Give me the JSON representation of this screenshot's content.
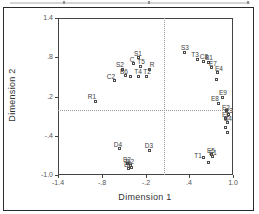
{
  "chart_data": {
    "type": "scatter",
    "title": "",
    "xlabel": "Dimension 1",
    "ylabel": "Dimension 2",
    "xlim": [
      -1.4,
      1.0
    ],
    "ylim": [
      -1.0,
      1.4
    ],
    "xticks": [
      -1.4,
      -0.8,
      -0.2,
      0.4,
      1.0
    ],
    "xtick_labels": [
      "-1.4",
      "-.8",
      "-.2",
      ".4",
      "1.0"
    ],
    "yticks": [
      1.4,
      0.8,
      0.2,
      -0.4,
      -1.0
    ],
    "ytick_labels": [
      "1.4",
      ".8",
      ".2",
      "-.4",
      "-1.0"
    ],
    "grid": false,
    "crosshair": {
      "x": 0.05,
      "y": 0.0,
      "style": "dotted"
    },
    "marker_style": "open-square",
    "points": [
      {
        "label": "S1",
        "x": -0.3,
        "y": 0.79,
        "dx": 0,
        "dy": -8
      },
      {
        "label": "C",
        "x": -0.36,
        "y": 0.7,
        "dx": -2,
        "dy": -8
      },
      {
        "label": "T5",
        "x": -0.27,
        "y": 0.66,
        "dx": 1,
        "dy": -8
      },
      {
        "label": "S2",
        "x": -0.51,
        "y": 0.62,
        "dx": -3,
        "dy": -8
      },
      {
        "label": "R",
        "x": -0.14,
        "y": 0.62,
        "dx": 2,
        "dy": -8
      },
      {
        "label": "B6",
        "x": -0.47,
        "y": 0.52,
        "dx": -2,
        "dy": -8
      },
      {
        "label": "T4",
        "x": -0.3,
        "y": 0.51,
        "dx": 0,
        "dy": -8
      },
      {
        "label": "T2",
        "x": -0.19,
        "y": 0.51,
        "dx": 1,
        "dy": -8
      },
      {
        "label": "",
        "x": -0.4,
        "y": 0.5,
        "dx": 0,
        "dy": -8
      },
      {
        "label": "C2",
        "x": -0.63,
        "y": 0.44,
        "dx": -3,
        "dy": -8
      },
      {
        "label": "R1",
        "x": -0.89,
        "y": 0.13,
        "dx": -3,
        "dy": -8
      },
      {
        "label": "S3",
        "x": 0.34,
        "y": 0.88,
        "dx": 0,
        "dy": -8
      },
      {
        "label": "T3",
        "x": 0.51,
        "y": 0.77,
        "dx": -2,
        "dy": -8
      },
      {
        "label": "C8",
        "x": 0.6,
        "y": 0.74,
        "dx": 0,
        "dy": -8
      },
      {
        "label": "B1",
        "x": 0.66,
        "y": 0.72,
        "dx": 1,
        "dy": -8
      },
      {
        "label": "E7",
        "x": 0.71,
        "y": 0.64,
        "dx": 1,
        "dy": -8
      },
      {
        "label": "E4",
        "x": 0.79,
        "y": 0.56,
        "dx": 1,
        "dy": -8
      },
      {
        "label": "",
        "x": 0.77,
        "y": 0.46,
        "dx": 0,
        "dy": -8
      },
      {
        "label": "E9",
        "x": 0.86,
        "y": 0.19,
        "dx": 0,
        "dy": -8
      },
      {
        "label": "E8",
        "x": 0.8,
        "y": 0.1,
        "dx": -3,
        "dy": -8
      },
      {
        "label": "E2",
        "x": 0.91,
        "y": -0.02,
        "dx": 0,
        "dy": -7
      },
      {
        "label": "E3",
        "x": 0.94,
        "y": -0.07,
        "dx": 0,
        "dy": -7
      },
      {
        "label": "E6",
        "x": 0.9,
        "y": -0.13,
        "dx": 0,
        "dy": -7
      },
      {
        "label": "B4",
        "x": 0.93,
        "y": -0.19,
        "dx": 0,
        "dy": -7
      },
      {
        "label": "",
        "x": 0.9,
        "y": -0.27,
        "dx": 0,
        "dy": -7
      },
      {
        "label": "",
        "x": 0.92,
        "y": -0.35,
        "dx": 0,
        "dy": -7
      },
      {
        "label": "T1",
        "x": 0.6,
        "y": -0.74,
        "dx": -6,
        "dy": -6
      },
      {
        "label": "E5",
        "x": 0.7,
        "y": -0.68,
        "dx": 0,
        "dy": -7
      },
      {
        "label": "E1",
        "x": 0.72,
        "y": -0.71,
        "dx": 0,
        "dy": -7
      },
      {
        "label": "",
        "x": 0.67,
        "y": -0.81,
        "dx": 0,
        "dy": -7
      },
      {
        "label": "D4",
        "x": -0.56,
        "y": -0.6,
        "dx": -1,
        "dy": -8
      },
      {
        "label": "D3",
        "x": -0.14,
        "y": -0.62,
        "dx": -1,
        "dy": -8
      },
      {
        "label": "B2",
        "x": -0.45,
        "y": -0.82,
        "dx": 0,
        "dy": -7
      },
      {
        "label": "D2",
        "x": -0.41,
        "y": -0.85,
        "dx": 0,
        "dy": -7
      },
      {
        "label": "B5",
        "x": -0.44,
        "y": -0.9,
        "dx": 0,
        "dy": -7
      },
      {
        "label": "",
        "x": -0.39,
        "y": -0.89,
        "dx": 0,
        "dy": -7
      }
    ]
  }
}
